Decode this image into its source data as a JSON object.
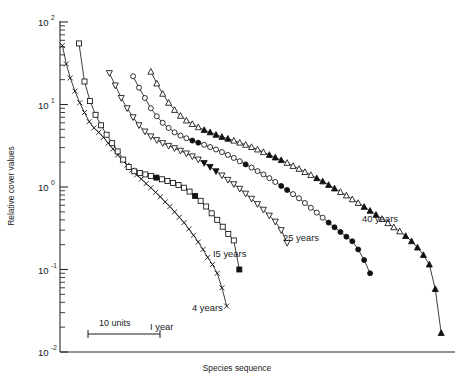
{
  "chart_data": {
    "type": "line",
    "title": "",
    "xlabel": "Species sequence",
    "ylabel": "Relative cover values",
    "yscale": "log",
    "ylim": [
      0.01,
      100
    ],
    "xlim": [
      0,
      100
    ],
    "grid": false,
    "legend_position": "inline-annotations",
    "ytick_labels": [
      "10²",
      "10¹",
      "10⁰",
      "10⁻¹",
      "10⁻²"
    ],
    "ytick_values": [
      100,
      10,
      1,
      0.1,
      0.01
    ],
    "ytick_base": "10",
    "ytick_exponents": [
      "2",
      "1",
      "0",
      "-1",
      "-2"
    ],
    "scale_bar": {
      "label": "10 units",
      "units": 10
    },
    "series": [
      {
        "name": "1 year",
        "label": "I year",
        "marker": "cross",
        "label_x": 150,
        "label_y": 330,
        "x": [
          0.6,
          1.6,
          2.6,
          3.8,
          5.0,
          6.2,
          7.4,
          8.6,
          9.8,
          11.0,
          12.2,
          13.4,
          14.6,
          15.8,
          17.0,
          18.2,
          19.4,
          20.6,
          21.8,
          23.0,
          24.2,
          25.4,
          26.6,
          27.8,
          29.0,
          30.2,
          31.4,
          32.6,
          33.8,
          35.0,
          36.2,
          37.4,
          38.6,
          39.8,
          41.0,
          42.2
        ],
        "y": [
          52.0,
          31.0,
          21.0,
          14.5,
          10.5,
          8.0,
          6.2,
          5.2,
          4.6,
          4.0,
          3.4,
          2.9,
          2.45,
          2.1,
          1.85,
          1.6,
          1.4,
          1.25,
          1.1,
          0.98,
          0.86,
          0.76,
          0.66,
          0.58,
          0.5,
          0.43,
          0.37,
          0.31,
          0.26,
          0.215,
          0.175,
          0.14,
          0.115,
          0.09,
          0.06,
          0.036
        ]
      },
      {
        "name": "4 years",
        "label": "4 years",
        "marker": "square",
        "label_x": 192,
        "label_y": 311,
        "x": [
          4.8,
          6.2,
          7.6,
          9.0,
          10.4,
          11.8,
          13.2,
          14.6,
          16.0,
          17.4,
          18.8,
          20.2,
          21.6,
          23.0,
          24.4,
          25.8,
          27.2,
          28.6,
          30.0,
          31.4,
          32.8,
          34.2,
          35.6,
          37.0,
          38.4,
          39.8,
          41.2,
          42.6,
          44.0,
          45.4
        ],
        "y": [
          55.0,
          19.0,
          11.0,
          7.5,
          5.6,
          4.3,
          3.4,
          2.7,
          2.15,
          1.75,
          1.55,
          1.48,
          1.42,
          1.36,
          1.3,
          1.24,
          1.18,
          1.12,
          1.06,
          0.98,
          0.88,
          0.78,
          0.68,
          0.58,
          0.48,
          0.4,
          0.33,
          0.27,
          0.225,
          0.1
        ],
        "filled_indices": [
          14,
          21,
          29
        ]
      },
      {
        "name": "15 years",
        "label": "I5 years",
        "marker": "triangle-down",
        "label_x": 213,
        "label_y": 257,
        "x": [
          12.5,
          14.0,
          15.5,
          17.0,
          18.5,
          20.0,
          21.5,
          23.0,
          24.5,
          26.0,
          27.5,
          29.0,
          30.5,
          32.0,
          33.5,
          35.0,
          36.5,
          38.0,
          39.5,
          41.0,
          42.5,
          44.0,
          45.5,
          47.0,
          48.5,
          50.0,
          51.5,
          53.0,
          54.5,
          56.0,
          57.5
        ],
        "y": [
          24.0,
          17.0,
          12.0,
          9.0,
          7.0,
          5.6,
          4.7,
          4.1,
          3.7,
          3.4,
          3.15,
          2.95,
          2.75,
          2.55,
          2.35,
          2.15,
          1.95,
          1.75,
          1.55,
          1.38,
          1.22,
          1.08,
          0.95,
          0.83,
          0.72,
          0.62,
          0.53,
          0.45,
          0.38,
          0.3,
          0.21
        ],
        "filled_indices": [
          16,
          17,
          18
        ]
      },
      {
        "name": "25 years",
        "label": "25 years",
        "marker": "circle",
        "label_x": 283,
        "label_y": 241,
        "x": [
          18.5,
          20.0,
          21.5,
          23.0,
          24.5,
          26.0,
          27.5,
          29.0,
          30.5,
          32.0,
          33.5,
          35.0,
          36.5,
          38.0,
          39.5,
          41.0,
          42.5,
          44.0,
          45.5,
          47.0,
          48.5,
          50.0,
          51.5,
          53.0,
          54.5,
          56.0,
          57.5,
          59.0,
          60.5,
          62.0,
          63.5,
          65.0,
          66.5,
          68.0,
          69.5,
          71.0,
          72.5,
          74.0,
          75.5,
          77.0,
          78.5
        ],
        "y": [
          22.0,
          16.0,
          12.0,
          9.0,
          7.2,
          6.0,
          5.2,
          4.6,
          4.2,
          3.9,
          3.65,
          3.45,
          3.25,
          3.05,
          2.85,
          2.65,
          2.45,
          2.25,
          2.05,
          1.88,
          1.72,
          1.56,
          1.42,
          1.28,
          1.15,
          1.03,
          0.92,
          0.82,
          0.73,
          0.64,
          0.56,
          0.49,
          0.425,
          0.37,
          0.325,
          0.285,
          0.25,
          0.22,
          0.175,
          0.13,
          0.09
        ],
        "filled_indices": [
          10,
          11,
          19,
          25,
          26,
          33,
          34,
          35,
          36,
          37,
          38,
          39,
          40
        ]
      },
      {
        "name": "40 years",
        "label": "40 years",
        "marker": "triangle-up",
        "label_x": 362,
        "label_y": 222,
        "x": [
          23.0,
          24.5,
          26.0,
          27.5,
          29.0,
          30.5,
          32.0,
          33.5,
          35.0,
          36.5,
          38.0,
          39.5,
          41.0,
          42.5,
          44.0,
          45.5,
          47.0,
          48.5,
          50.0,
          51.5,
          53.0,
          54.5,
          56.0,
          57.5,
          59.0,
          60.5,
          62.0,
          63.5,
          65.0,
          66.5,
          68.0,
          69.5,
          71.0,
          72.5,
          74.0,
          75.5,
          77.0,
          78.5,
          80.0,
          81.5,
          83.0,
          84.5,
          86.0,
          87.5,
          89.0,
          90.5,
          92.0,
          93.5,
          95.0,
          96.5
        ],
        "y": [
          25.0,
          18.0,
          13.5,
          10.5,
          8.6,
          7.3,
          6.4,
          5.8,
          5.3,
          4.9,
          4.6,
          4.3,
          4.05,
          3.85,
          3.65,
          3.45,
          3.25,
          3.05,
          2.85,
          2.65,
          2.45,
          2.28,
          2.12,
          1.96,
          1.8,
          1.66,
          1.52,
          1.4,
          1.28,
          1.17,
          1.06,
          0.96,
          0.87,
          0.79,
          0.71,
          0.64,
          0.575,
          0.515,
          0.46,
          0.41,
          0.365,
          0.325,
          0.29,
          0.255,
          0.22,
          0.185,
          0.15,
          0.115,
          0.058,
          0.017
        ],
        "filled_indices": [
          9,
          10,
          11,
          12,
          13,
          20,
          21,
          22,
          28,
          29,
          30,
          31,
          36,
          37,
          38,
          43,
          44,
          45,
          46,
          47,
          48,
          49
        ]
      }
    ]
  }
}
